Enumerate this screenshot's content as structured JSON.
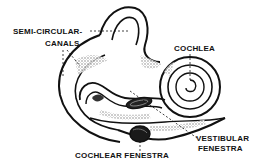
{
  "diagram": {
    "labels": {
      "semicircular_line1": "SEMI-CIRCULAR-",
      "semicircular_line2": "CANALS",
      "cochlea": "COCHLEA",
      "vestibular_line1": "VESTIBULAR",
      "vestibular_line2": "FENESTRA",
      "cochlear_fenestra": "COCHLEAR FENESTRA"
    },
    "colors": {
      "ink": "#111111",
      "shading": "#8a8a8a",
      "background": "#ffffff"
    }
  }
}
